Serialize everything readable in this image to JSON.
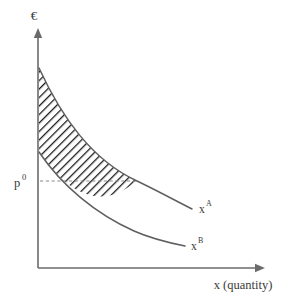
{
  "figure": {
    "title": "",
    "background_color": "#ffffff",
    "axis_color": "#6b6b6b",
    "curve_color": "#5f5f5f",
    "hatch_color": "#1a1a1a",
    "dashed_color": "#8a8a8a"
  },
  "axes": {
    "y_label": "€",
    "x_label": "x (quantity)",
    "origin": {
      "x": 38,
      "y": 268
    },
    "y_axis_top": {
      "x": 38,
      "y": 28
    },
    "x_axis_right": {
      "x": 265,
      "y": 268
    }
  },
  "price_marker": {
    "label_base": "p",
    "label_superscript": "0",
    "label_full": "p0",
    "value_y": 181,
    "dash_from_x": 40,
    "dash_to_x": 137
  },
  "curves": [
    {
      "id": "curve-a",
      "label_base": "x",
      "label_superscript": "A",
      "label_full": "xA",
      "label_position": {
        "x": 199,
        "y": 208
      },
      "start": {
        "x": 39,
        "y": 68
      },
      "end": {
        "x": 192,
        "y": 209
      },
      "path": "M 39 68 C 62 118, 92 160, 137 181 C 160 192, 176 201, 192 209"
    },
    {
      "id": "curve-b",
      "label_base": "x",
      "label_superscript": "B",
      "label_full": "xB",
      "label_position": {
        "x": 191,
        "y": 245
      },
      "start": {
        "x": 39,
        "y": 152
      },
      "end": {
        "x": 185,
        "y": 246
      },
      "path": "M 39 152 C 62 186, 96 214, 134 231 C 152 239, 170 243, 185 246"
    }
  ],
  "shaded_region": {
    "name": "consumer-surplus-difference",
    "pattern": "diagonal-hatch",
    "hatch_angle_deg": 45,
    "hatch_spacing_px": 4.2,
    "path": "M 39 68 C 62 118, 92 160, 137 181 L 134 183 C 96 214, 62 186, 39 152 Z"
  },
  "chart_data": {
    "type": "line",
    "title": "",
    "xlabel": "x (quantity)",
    "ylabel": "€",
    "grid": false,
    "legend": "inline-curve-labels",
    "annotations": [
      {
        "text": "p0",
        "type": "price-level",
        "axis": "y"
      },
      {
        "text": "xA",
        "type": "curve-label"
      },
      {
        "text": "xB",
        "type": "curve-label"
      }
    ],
    "series": [
      {
        "name": "xA",
        "description": "upper demand curve",
        "points": [
          {
            "x": 0,
            "y": 100
          },
          {
            "x": 25,
            "y": 62
          },
          {
            "x": 55,
            "y": 38
          },
          {
            "x": 100,
            "y": 22
          },
          {
            "x": 155,
            "y": 11
          }
        ]
      },
      {
        "name": "xB",
        "description": "lower demand curve",
        "points": [
          {
            "x": 0,
            "y": 56
          },
          {
            "x": 25,
            "y": 38
          },
          {
            "x": 60,
            "y": 22
          },
          {
            "x": 100,
            "y": 13
          },
          {
            "x": 148,
            "y": 9
          }
        ]
      }
    ],
    "shaded_between": [
      "xA",
      "xB"
    ],
    "reference_lines": [
      {
        "axis": "y",
        "label": "p0",
        "value": 22,
        "style": "dashed"
      }
    ]
  }
}
